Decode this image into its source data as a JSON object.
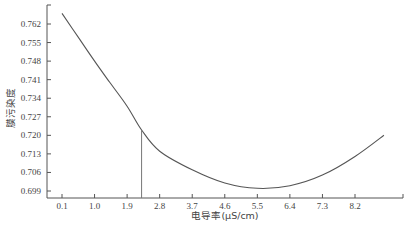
{
  "chart_data": {
    "type": "line",
    "title": "",
    "xlabel": "电导率(μS/cm)",
    "ylabel": "膜污染度",
    "x_ticks": [
      "0.1",
      "1.0",
      "1.9",
      "2.8",
      "3.7",
      "4.6",
      "5.5",
      "6.4",
      "7.3",
      "8.2"
    ],
    "y_ticks": [
      "0.699",
      "0.706",
      "0.713",
      "0.720",
      "0.727",
      "0.734",
      "0.741",
      "0.748",
      "0.755",
      "0.762"
    ],
    "xlim": [
      0.1,
      9.5
    ],
    "ylim": [
      0.697,
      0.769
    ],
    "grid": false,
    "legend": null,
    "series": [
      {
        "name": "膜污染度",
        "color": "#555555",
        "x": [
          0.1,
          0.6,
          1.0,
          1.42,
          1.9,
          2.3,
          2.8,
          3.7,
          4.6,
          5.5,
          6.4,
          7.3,
          8.2,
          9.0
        ],
        "y": [
          0.766,
          0.756,
          0.748,
          0.74,
          0.731,
          0.722,
          0.714,
          0.707,
          0.702,
          0.7,
          0.701,
          0.705,
          0.712,
          0.72
        ]
      }
    ],
    "annotations": [
      {
        "type": "vertical-line",
        "x": 2.3,
        "y_top": 0.722,
        "y_bottom": 0.697,
        "color": "#777777"
      }
    ]
  },
  "layout": {
    "axis_color": "#555555",
    "plot": {
      "left": 47,
      "top": 5,
      "right": 403,
      "bottom": 198
    },
    "x_px": {
      "v0": 0.1,
      "p0": 62,
      "v1": 8.2,
      "p1": 355
    },
    "y_px": {
      "v0": 0.699,
      "p0": 191,
      "v1": 0.762,
      "p1": 24
    }
  }
}
